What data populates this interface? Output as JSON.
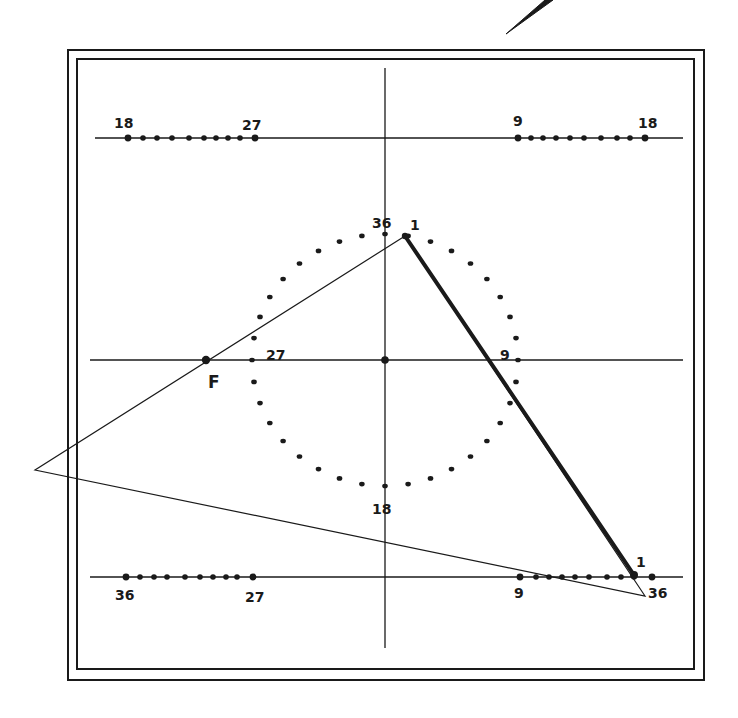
{
  "diagram": {
    "type": "geometric-construction",
    "colors": {
      "ink": "#1a1a1a",
      "paper": "#ffffff"
    },
    "frame": {
      "outer": {
        "x": 68,
        "y": 50,
        "w": 636,
        "h": 630
      },
      "inner": {
        "x": 77,
        "y": 59,
        "w": 617,
        "h": 610
      }
    },
    "pen_stroke": {
      "x1": 506,
      "y1": 34,
      "x2": 548,
      "y2": 0
    },
    "vertical_axis": {
      "x": 385,
      "y1": 68,
      "y2": 648
    },
    "horizontal_lines": [
      {
        "name": "top-line",
        "y": 138,
        "x1": 95,
        "x2": 683
      },
      {
        "name": "middle-line",
        "y": 360,
        "x1": 90,
        "x2": 683
      },
      {
        "name": "bottom-line",
        "y": 577,
        "x1": 90,
        "x2": 683
      }
    ],
    "circle": {
      "cx": 385,
      "cy": 360,
      "rx": 133,
      "ry": 126,
      "dot_count": 36
    },
    "circle_labels": [
      {
        "text": "36",
        "x": 372,
        "y": 228
      },
      {
        "text": "1",
        "x": 410,
        "y": 230
      },
      {
        "text": "27",
        "x": 266,
        "y": 360
      },
      {
        "text": "9",
        "x": 500,
        "y": 360
      },
      {
        "text": "18",
        "x": 372,
        "y": 514
      }
    ],
    "center_point": {
      "x": 385,
      "y": 360
    },
    "focus_point": {
      "label": "F",
      "x": 206,
      "y": 360,
      "label_x": 208,
      "label_y": 388
    },
    "triangle": {
      "apex": {
        "x": 405,
        "y": 236
      },
      "left": {
        "x": 35,
        "y": 470
      },
      "bottom_right": {
        "x": 645,
        "y": 596
      }
    },
    "thick_line": {
      "x1": 405,
      "y1": 236,
      "x2": 634,
      "y2": 575
    },
    "scales": [
      {
        "name": "top-left-scale",
        "y": 138,
        "dots_x": [
          128,
          143,
          157,
          172,
          189,
          204,
          216,
          228,
          240,
          255
        ],
        "labels": [
          {
            "text": "18",
            "x": 114,
            "y": 128
          },
          {
            "text": "27",
            "x": 242,
            "y": 130
          }
        ]
      },
      {
        "name": "top-right-scale",
        "y": 138,
        "dots_x": [
          518,
          531,
          543,
          556,
          570,
          584,
          601,
          617,
          630,
          645
        ],
        "labels": [
          {
            "text": "9",
            "x": 513,
            "y": 126
          },
          {
            "text": "18",
            "x": 638,
            "y": 128
          }
        ]
      },
      {
        "name": "bottom-left-scale",
        "y": 577,
        "dots_x": [
          126,
          140,
          154,
          167,
          185,
          200,
          213,
          226,
          237,
          253
        ],
        "labels": [
          {
            "text": "36",
            "x": 115,
            "y": 600
          },
          {
            "text": "27",
            "x": 245,
            "y": 602
          }
        ]
      },
      {
        "name": "bottom-right-scale",
        "y": 577,
        "dots_x": [
          520,
          536,
          549,
          562,
          575,
          589,
          607,
          621,
          634,
          652
        ],
        "labels": [
          {
            "text": "9",
            "x": 514,
            "y": 598
          },
          {
            "text": "1",
            "x": 636,
            "y": 567
          },
          {
            "text": "36",
            "x": 648,
            "y": 598
          }
        ]
      }
    ]
  }
}
